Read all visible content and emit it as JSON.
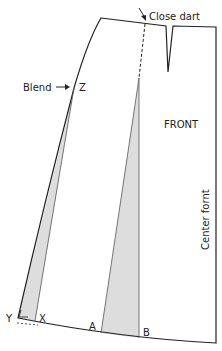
{
  "diagram": {
    "type": "sewing-pattern",
    "piece": "skirt front",
    "labels": {
      "close_dart": "Close dart",
      "blend": "Blend",
      "front": "FRONT",
      "center_front": "Center fornt",
      "point_z": "Z",
      "point_y": "Y",
      "point_x": "X",
      "point_a": "A",
      "point_b": "B"
    },
    "colors": {
      "outline": "#222222",
      "fill_shaded": "#dddddd",
      "background": "#ffffff"
    }
  }
}
